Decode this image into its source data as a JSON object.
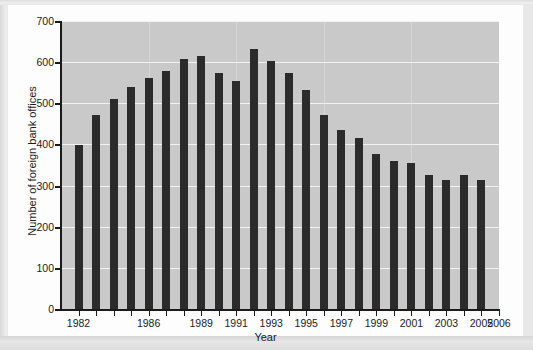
{
  "figure": {
    "background_color": "#fdfdfd",
    "page_background_color": "#e8e8e8",
    "plot_background_color": "#c9c9c9",
    "bar_color": "#2b2b2b",
    "gridline_color": "#f2f2f2",
    "axis_color": "#1a1a1a"
  },
  "chart_data": {
    "type": "bar",
    "title": "",
    "xlabel": "Year",
    "ylabel": "Number of foreign bank offices",
    "ylim": [
      0,
      700
    ],
    "ytick_values": [
      0,
      100,
      200,
      300,
      400,
      500,
      600,
      700
    ],
    "ytick_labels": [
      "0",
      "100",
      "200",
      "300",
      "400",
      "500",
      "600",
      "700"
    ],
    "xtick_labels": [
      "1982",
      "1986",
      "1989",
      "1991",
      "1993",
      "1995",
      "1997",
      "1999",
      "2001",
      "2003",
      "2005",
      "2006"
    ],
    "grid": "horizontal",
    "legend": "none",
    "categories": [
      "1982",
      "1983",
      "1984",
      "1985",
      "1986",
      "1987",
      "1988",
      "1989",
      "1990",
      "1991",
      "1992",
      "1993",
      "1994",
      "1995",
      "1996",
      "1997",
      "1998",
      "1999",
      "2000",
      "2001",
      "2002",
      "2003",
      "2004",
      "2005"
    ],
    "values": [
      402,
      475,
      512,
      542,
      565,
      582,
      610,
      617,
      577,
      556,
      634,
      605,
      576,
      535,
      475,
      437,
      419,
      378,
      362,
      357,
      329,
      315,
      329,
      315
    ],
    "series": [
      {
        "name": "Number of foreign bank offices",
        "values": [
          402,
          475,
          512,
          542,
          565,
          582,
          610,
          617,
          577,
          556,
          634,
          605,
          576,
          535,
          475,
          437,
          419,
          378,
          362,
          357,
          329,
          315,
          329,
          315
        ]
      }
    ]
  }
}
